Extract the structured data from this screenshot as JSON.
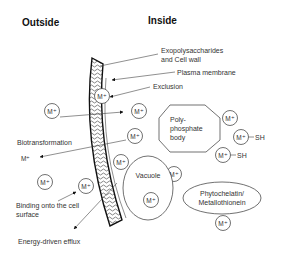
{
  "headers": {
    "outside": "Outside",
    "inside": "Inside"
  },
  "labels": {
    "exopolysaccharides_line1": "Exopolysaccharides",
    "exopolysaccharides_line2": "and Cell wall",
    "plasma_membrane": "Plasma membrane",
    "exclusion": "Exclusion",
    "biotransformation": "Biotransformation",
    "binding_line1": "Binding onto the cell",
    "binding_line2": "surface",
    "efflux": "Energy-driven efflux",
    "polyphosphate_line1": "Poly-",
    "polyphosphate_line2": "phosphate",
    "polyphosphate_line3": "body",
    "vacuole": "Vacuole",
    "phytochelatin_line1": "Phytochelatin/",
    "phytochelatin_line2": "Metallothionein",
    "sh": "SH"
  },
  "ions": {
    "metal": "M⁺",
    "transformed": "M⁺"
  },
  "colors": {
    "stroke": "#222222",
    "text": "#333333",
    "background": "#ffffff"
  }
}
